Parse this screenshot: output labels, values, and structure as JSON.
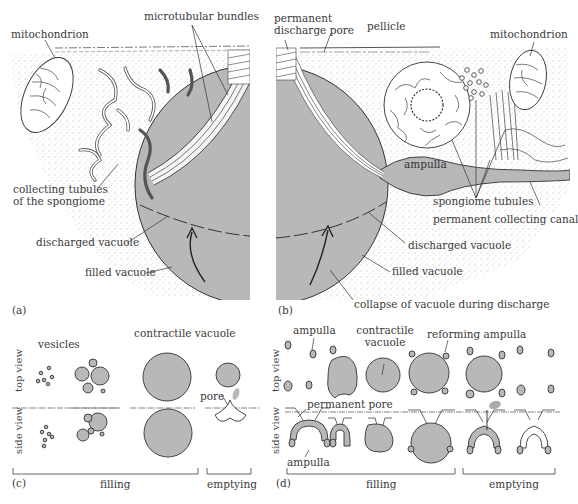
{
  "colors": {
    "vacuole_fill": "#b8b8b8",
    "outline": "#3a3a3a",
    "stipple": "#d4d4d4",
    "background": "#ffffff"
  },
  "panel_a": {
    "tag": "(a)",
    "labels": {
      "mitochondrion": "mitochondrion",
      "microtubular_bundles": "microtubular bundles",
      "collecting_tubules_l1": "collecting tubules",
      "collecting_tubules_l2": "of the spongiome",
      "discharged_vacuole": "discharged vacuole",
      "filled_vacuole": "filled vacuole"
    }
  },
  "panel_b": {
    "tag": "(b)",
    "labels": {
      "pore_l1": "permanent",
      "pore_l2": "discharge pore",
      "pellicle": "pellicle",
      "mitochondrion": "mitochondrion",
      "ampulla": "ampulla",
      "spongiome_tubules": "spongiome tubules",
      "collecting_canal": "permanent collecting canal",
      "discharged_vacuole": "discharged vacuole",
      "filled_vacuole": "filled vacuole",
      "collapse": "collapse of vacuole during discharge"
    }
  },
  "panel_c": {
    "tag": "(c)",
    "row_labels": {
      "top": "top view",
      "side": "side view"
    },
    "labels": {
      "vesicles": "vesicles",
      "contractile_vacuole": "contractile vacuole",
      "pore": "pore"
    },
    "phases": {
      "filling": "filling",
      "emptying": "emptying"
    }
  },
  "panel_d": {
    "tag": "(d)",
    "row_labels": {
      "top": "top view",
      "side": "side view"
    },
    "labels": {
      "ampulla_top": "ampulla",
      "contractile_l1": "contractile",
      "contractile_l2": "vacuole",
      "reforming_ampulla": "reforming ampulla",
      "permanent_pore": "permanent pore",
      "ampulla_side": "ampulla"
    },
    "phases": {
      "filling": "filling",
      "emptying": "emptying"
    }
  }
}
